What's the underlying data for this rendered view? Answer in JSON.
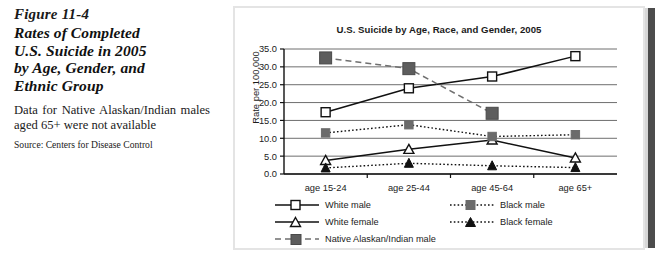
{
  "caption": {
    "figure_number": "Figure 11-4",
    "title_lines": [
      "Rates of Completed",
      "U.S. Suicide in 2005",
      "by Age, Gender, and",
      "Ethnic Group"
    ],
    "note": "Data for Native Alaskan/Indian males aged 65+ were not available",
    "source": "Source: Centers for Disease Control"
  },
  "chart_data": {
    "type": "line",
    "title": "U.S. Suicide by Age, Race, and Gender, 2005",
    "xlabel": "",
    "ylabel": "Rate per 100,000",
    "categories": [
      "age 15-24",
      "age 25-44",
      "age 45-64",
      "age 65+"
    ],
    "ylim": [
      0.0,
      35.0
    ],
    "ytick_labels": [
      "0.0",
      "5.0",
      "10.0",
      "15.0",
      "20.0",
      "25.0",
      "30.0",
      "35.0"
    ],
    "ytick_values": [
      0.0,
      5.0,
      10.0,
      15.0,
      20.0,
      25.0,
      30.0,
      35.0
    ],
    "grid": true,
    "legend_position": "bottom",
    "series": [
      {
        "name": "White male",
        "values": [
          17.3,
          24.0,
          27.3,
          33.0
        ],
        "line_style": "solid",
        "marker": "open-square",
        "color": "#111111"
      },
      {
        "name": "White female",
        "values": [
          3.8,
          6.9,
          9.5,
          4.5
        ],
        "line_style": "solid",
        "marker": "open-triangle",
        "color": "#111111"
      },
      {
        "name": "Native Alaskan/Indian male",
        "values": [
          32.5,
          29.5,
          17.0,
          null
        ],
        "line_style": "dashed",
        "marker": "filled-square",
        "color": "#6f6f6f"
      },
      {
        "name": "Black male",
        "values": [
          11.5,
          13.8,
          10.5,
          11.0
        ],
        "line_style": "dotted",
        "marker": "filled-square",
        "color": "#111111"
      },
      {
        "name": "Black female",
        "values": [
          1.7,
          3.0,
          2.3,
          1.8
        ],
        "line_style": "dotted",
        "marker": "filled-triangle",
        "color": "#111111"
      }
    ]
  },
  "legend": {
    "rows": [
      [
        "White male",
        "Black male"
      ],
      [
        "White female",
        "Black female"
      ],
      [
        "Native Alaskan/Indian male"
      ]
    ]
  }
}
